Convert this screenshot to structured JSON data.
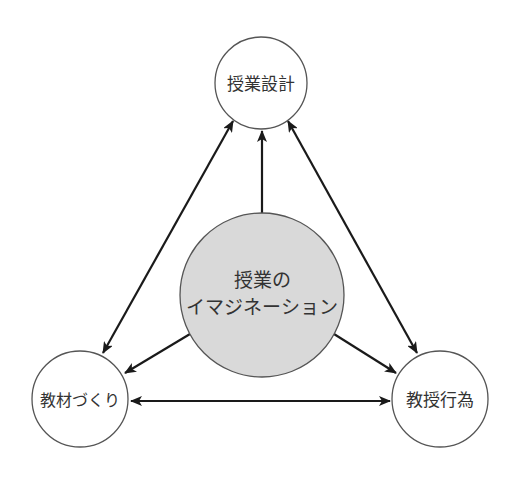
{
  "diagram": {
    "nodes": [
      {
        "id": "center",
        "label_lines": [
          "授業の",
          "イマジネーション"
        ],
        "cx": 262,
        "cy": 295,
        "r": 82,
        "fill": "#d9d9d9"
      },
      {
        "id": "top",
        "label": "授業設計",
        "cx": 261,
        "cy": 83,
        "r": 46,
        "fill": "#ffffff"
      },
      {
        "id": "left",
        "label": "教材づくり",
        "cx": 80,
        "cy": 399,
        "r": 48,
        "fill": "#ffffff"
      },
      {
        "id": "right",
        "label": "教授行為",
        "cx": 440,
        "cy": 399,
        "r": 48,
        "fill": "#ffffff"
      }
    ],
    "edges": [
      {
        "from": "center",
        "to": "top",
        "type": "one-way"
      },
      {
        "from": "center",
        "to": "left",
        "type": "one-way"
      },
      {
        "from": "center",
        "to": "right",
        "type": "one-way"
      },
      {
        "from": "top",
        "to": "left",
        "type": "two-way"
      },
      {
        "from": "top",
        "to": "right",
        "type": "two-way"
      },
      {
        "from": "left",
        "to": "right",
        "type": "two-way"
      }
    ],
    "colors": {
      "stroke": "#555555",
      "arrow": "#1a1a1a",
      "center_fill": "#d9d9d9",
      "text": "#333333"
    }
  }
}
